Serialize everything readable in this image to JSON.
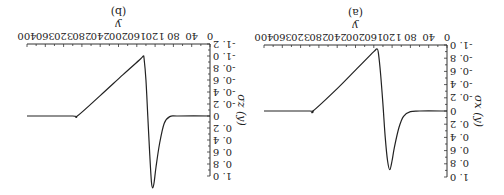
{
  "figure": {
    "orientation": "rotated 180 degrees"
  },
  "chart_data": [
    {
      "type": "line",
      "panel": "(a)",
      "title": "(a)",
      "xlabel": "y",
      "ylabel": "σ_x (y)",
      "xlim": [
        0,
        400
      ],
      "ylim": [
        -1.0,
        1.0
      ],
      "xticks": [
        "0",
        "40",
        "80",
        "120",
        "160",
        "200",
        "240",
        "280",
        "320",
        "360",
        "400"
      ],
      "yticks": [
        "-1.0",
        "-0.8",
        "-0.6",
        "-0.4",
        "-0.2",
        "0",
        "0.2",
        "0.4",
        "0.6",
        "0.8",
        "1.0"
      ],
      "grid": false,
      "series": [
        {
          "name": "σ_x(y)",
          "x": [
            0,
            60,
            80,
            95,
            105,
            115,
            120,
            125,
            130,
            135,
            140,
            145,
            150,
            153,
            160,
            200,
            240,
            293,
            300,
            400
          ],
          "y": [
            0,
            0,
            -0.01,
            -0.08,
            -0.25,
            -0.55,
            -0.75,
            -0.89,
            -0.75,
            -0.4,
            0.1,
            0.55,
            0.88,
            0.94,
            0.9,
            0.62,
            0.34,
            0,
            0,
            0
          ]
        }
      ]
    },
    {
      "type": "line",
      "panel": "(b)",
      "title": "(b)",
      "xlabel": "y",
      "ylabel": "σ_z (y)",
      "xlim": [
        0,
        400
      ],
      "ylim": [
        -1.2,
        1.0
      ],
      "xticks": [
        "0",
        "40",
        "80",
        "120",
        "160",
        "200",
        "240",
        "280",
        "320",
        "360",
        "400"
      ],
      "yticks": [
        "-1.2",
        "-1.0",
        "-0.8",
        "-0.6",
        "-0.4",
        "-0.2",
        "0",
        "0.2",
        "0.4",
        "0.6",
        "0.8",
        "1.0"
      ],
      "grid": false,
      "series": [
        {
          "name": "σ_z(y)",
          "x": [
            0,
            70,
            88,
            100,
            110,
            118,
            122,
            125,
            128,
            132,
            136,
            140,
            144,
            146,
            152,
            190,
            240,
            290,
            300,
            400
          ],
          "y": [
            0,
            0,
            -0.01,
            -0.12,
            -0.45,
            -0.85,
            -1.1,
            -1.2,
            -1.1,
            -0.6,
            0.0,
            0.6,
            0.95,
            1.0,
            0.95,
            0.69,
            0.34,
            0,
            0,
            0
          ]
        }
      ]
    }
  ]
}
